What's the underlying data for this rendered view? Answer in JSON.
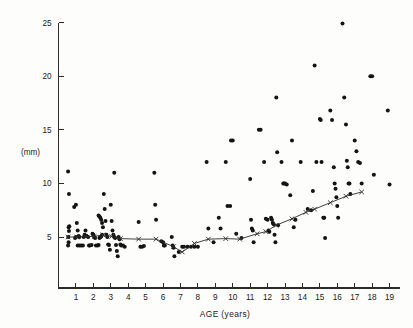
{
  "figure": {
    "title": "",
    "unit_label": "(mm)",
    "xlabel": "AGE  (years)"
  },
  "chart_data": {
    "type": "scatter",
    "title": "",
    "subtitle": "",
    "xlabel": "AGE (years)",
    "ylabel": "(mm)",
    "xlim": [
      0,
      19.6
    ],
    "ylim": [
      2.2,
      25.6
    ],
    "xticks": [
      1,
      2,
      3,
      4,
      5,
      6,
      7,
      8,
      9,
      10,
      11,
      12,
      13,
      14,
      15,
      16,
      17,
      18,
      19
    ],
    "xticklabels": [
      "1",
      "2",
      "3",
      "4",
      "5",
      "6",
      "7",
      "8",
      "9",
      "10",
      "11",
      "12",
      "13",
      "14",
      "15",
      "16",
      "17",
      "18",
      "19"
    ],
    "yticks": [
      5,
      10,
      15,
      20,
      25
    ],
    "yticklabels": [
      "5",
      "10",
      "15",
      "20",
      "25"
    ],
    "grid": false,
    "legend": "none",
    "series": [
      {
        "name": "individual measurements",
        "marker": "filled-circle",
        "marker_color": "#141414",
        "points": [
          [
            0.55,
            11.1
          ],
          [
            0.6,
            9.0
          ],
          [
            0.62,
            6.0
          ],
          [
            0.58,
            5.9
          ],
          [
            0.6,
            5.55
          ],
          [
            0.56,
            5.0
          ],
          [
            0.58,
            4.5
          ],
          [
            0.55,
            4.2
          ],
          [
            0.9,
            7.8
          ],
          [
            1.0,
            8.0
          ],
          [
            1.05,
            6.3
          ],
          [
            1.1,
            5.6
          ],
          [
            1.15,
            5.1
          ],
          [
            1.2,
            5.0
          ],
          [
            1.0,
            5.0
          ],
          [
            0.95,
            4.9
          ],
          [
            1.1,
            4.2
          ],
          [
            1.2,
            4.2
          ],
          [
            1.3,
            4.2
          ],
          [
            1.4,
            4.2
          ],
          [
            1.45,
            5.0
          ],
          [
            1.5,
            5.2
          ],
          [
            1.55,
            5.6
          ],
          [
            1.6,
            5.1
          ],
          [
            1.7,
            5.0
          ],
          [
            1.75,
            4.2
          ],
          [
            1.8,
            4.2
          ],
          [
            1.9,
            4.25
          ],
          [
            1.95,
            5.3
          ],
          [
            2.0,
            5.2
          ],
          [
            2.05,
            5.0
          ],
          [
            2.1,
            4.9
          ],
          [
            2.15,
            4.2
          ],
          [
            2.25,
            4.2
          ],
          [
            2.3,
            7.0
          ],
          [
            2.35,
            6.9
          ],
          [
            2.4,
            6.8
          ],
          [
            2.45,
            6.6
          ],
          [
            2.5,
            6.3
          ],
          [
            2.55,
            5.9
          ],
          [
            2.5,
            5.2
          ],
          [
            2.45,
            5.05
          ],
          [
            2.4,
            5.0
          ],
          [
            2.35,
            4.9
          ],
          [
            2.3,
            4.25
          ],
          [
            2.6,
            9.0
          ],
          [
            2.65,
            7.6
          ],
          [
            2.7,
            6.5
          ],
          [
            2.75,
            5.2
          ],
          [
            2.8,
            5.0
          ],
          [
            2.85,
            4.3
          ],
          [
            2.9,
            4.25
          ],
          [
            2.95,
            3.8
          ],
          [
            3.0,
            8.0
          ],
          [
            3.05,
            6.5
          ],
          [
            3.1,
            5.6
          ],
          [
            3.15,
            5.2
          ],
          [
            3.2,
            5.0
          ],
          [
            3.25,
            4.9
          ],
          [
            3.3,
            4.25
          ],
          [
            3.35,
            3.7
          ],
          [
            3.4,
            3.2
          ],
          [
            3.2,
            11.0
          ],
          [
            3.45,
            5.0
          ],
          [
            3.5,
            4.8
          ],
          [
            3.55,
            4.3
          ],
          [
            3.6,
            4.2
          ],
          [
            3.7,
            4.2
          ],
          [
            3.8,
            4.1
          ],
          [
            4.6,
            6.4
          ],
          [
            4.7,
            4.1
          ],
          [
            4.8,
            4.1
          ],
          [
            4.9,
            4.15
          ],
          [
            5.5,
            11.0
          ],
          [
            5.55,
            8.0
          ],
          [
            5.6,
            6.6
          ],
          [
            5.9,
            4.6
          ],
          [
            6.0,
            4.5
          ],
          [
            6.05,
            4.2
          ],
          [
            6.1,
            4.2
          ],
          [
            6.5,
            5.0
          ],
          [
            6.55,
            4.2
          ],
          [
            6.6,
            4.0
          ],
          [
            6.65,
            3.2
          ],
          [
            6.9,
            3.6
          ],
          [
            7.1,
            4.1
          ],
          [
            7.2,
            4.1
          ],
          [
            7.4,
            4.1
          ],
          [
            7.6,
            4.1
          ],
          [
            7.8,
            4.1
          ],
          [
            8.0,
            4.1
          ],
          [
            8.5,
            12.0
          ],
          [
            8.6,
            5.8
          ],
          [
            8.9,
            4.5
          ],
          [
            9.2,
            6.8
          ],
          [
            9.3,
            5.8
          ],
          [
            9.6,
            12.0
          ],
          [
            9.7,
            7.9
          ],
          [
            9.85,
            7.9
          ],
          [
            9.9,
            14.0
          ],
          [
            10.0,
            14.0
          ],
          [
            10.2,
            5.3
          ],
          [
            10.5,
            4.9
          ],
          [
            11.0,
            10.4
          ],
          [
            11.05,
            6.6
          ],
          [
            11.1,
            5.8
          ],
          [
            11.15,
            5.6
          ],
          [
            11.2,
            4.5
          ],
          [
            11.5,
            15.0
          ],
          [
            11.6,
            15.0
          ],
          [
            11.8,
            12.0
          ],
          [
            11.9,
            6.7
          ],
          [
            12.0,
            6.6
          ],
          [
            12.05,
            5.6
          ],
          [
            12.1,
            5.5
          ],
          [
            12.2,
            6.8
          ],
          [
            12.25,
            6.6
          ],
          [
            12.3,
            6.3
          ],
          [
            12.35,
            6.2
          ],
          [
            12.4,
            5.2
          ],
          [
            12.45,
            4.5
          ],
          [
            12.5,
            18.0
          ],
          [
            12.55,
            12.9
          ],
          [
            12.6,
            6.1
          ],
          [
            12.8,
            12.0
          ],
          [
            12.9,
            10.0
          ],
          [
            12.95,
            10.0
          ],
          [
            13.0,
            10.0
          ],
          [
            13.1,
            9.9
          ],
          [
            13.3,
            8.9
          ],
          [
            13.4,
            14.0
          ],
          [
            13.5,
            5.9
          ],
          [
            13.6,
            6.6
          ],
          [
            13.9,
            12.0
          ],
          [
            14.3,
            7.6
          ],
          [
            14.5,
            7.5
          ],
          [
            14.6,
            9.3
          ],
          [
            14.7,
            21.0
          ],
          [
            14.8,
            12.0
          ],
          [
            15.0,
            16.0
          ],
          [
            15.05,
            15.9
          ],
          [
            15.1,
            12.0
          ],
          [
            15.2,
            6.8
          ],
          [
            15.25,
            6.8
          ],
          [
            15.3,
            4.9
          ],
          [
            15.6,
            16.8
          ],
          [
            15.7,
            15.9
          ],
          [
            15.8,
            11.5
          ],
          [
            15.85,
            10.0
          ],
          [
            15.9,
            9.5
          ],
          [
            15.95,
            8.7
          ],
          [
            16.0,
            7.9
          ],
          [
            16.05,
            6.8
          ],
          [
            16.3,
            24.9
          ],
          [
            16.4,
            18.0
          ],
          [
            16.5,
            15.5
          ],
          [
            16.55,
            12.1
          ],
          [
            16.6,
            11.5
          ],
          [
            16.65,
            10.0
          ],
          [
            16.7,
            10.0
          ],
          [
            16.75,
            9.0
          ],
          [
            17.0,
            14.0
          ],
          [
            17.1,
            13.0
          ],
          [
            17.2,
            12.0
          ],
          [
            17.3,
            11.9
          ],
          [
            17.4,
            10.0
          ],
          [
            17.9,
            20.0
          ],
          [
            18.0,
            20.0
          ],
          [
            18.1,
            10.8
          ],
          [
            18.9,
            16.8
          ],
          [
            19.0,
            9.9
          ]
        ]
      }
    ],
    "trend_line": {
      "name": "mean",
      "marker": "x-cross",
      "color": "#2b2b2b",
      "points": [
        [
          0.55,
          5.0
        ],
        [
          1.05,
          5.0
        ],
        [
          1.55,
          5.05
        ],
        [
          2.05,
          5.05
        ],
        [
          2.55,
          5.2
        ],
        [
          3.05,
          5.05
        ],
        [
          3.55,
          4.85
        ],
        [
          4.6,
          4.8
        ],
        [
          5.6,
          4.8
        ],
        [
          6.6,
          4.1
        ],
        [
          7.1,
          3.6
        ],
        [
          7.8,
          4.4
        ],
        [
          8.6,
          4.8
        ],
        [
          9.6,
          4.85
        ],
        [
          10.4,
          4.8
        ],
        [
          11.4,
          5.3
        ],
        [
          11.9,
          5.5
        ],
        [
          12.5,
          6.1
        ],
        [
          13.4,
          6.7
        ],
        [
          14.2,
          7.3
        ],
        [
          14.7,
          7.6
        ],
        [
          15.6,
          8.2
        ],
        [
          16.5,
          8.8
        ],
        [
          17.4,
          9.2
        ]
      ]
    }
  }
}
